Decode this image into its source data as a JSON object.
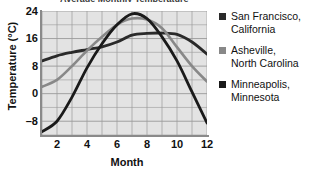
{
  "chart_data": {
    "type": "line",
    "title": "Average Monthly Temperature",
    "xlabel": "Month",
    "ylabel": "Temperature (°C)",
    "xlim": [
      1,
      12
    ],
    "ylim": [
      -12,
      24
    ],
    "xticks": [
      "2",
      "4",
      "6",
      "8",
      "10",
      "12"
    ],
    "xtick_values": [
      2,
      4,
      6,
      8,
      10,
      12
    ],
    "yticks": [
      "24",
      "16",
      "8",
      "0",
      "–8"
    ],
    "ytick_values": [
      24,
      16,
      8,
      0,
      -8
    ],
    "grid": true,
    "legend_position": "right",
    "x": [
      1,
      2,
      3,
      4,
      5,
      6,
      7,
      8,
      9,
      10,
      11,
      12
    ],
    "series": [
      {
        "name": "San Francisco, California",
        "color": "#2a2a2a",
        "values": [
          9.5,
          11.0,
          12.0,
          12.8,
          13.6,
          15.0,
          17.0,
          17.5,
          17.6,
          17.2,
          15.0,
          11.5
        ]
      },
      {
        "name": "Asheville, North Carolina",
        "color": "#888888",
        "values": [
          2.0,
          4.0,
          8.0,
          12.5,
          16.5,
          20.0,
          21.8,
          21.5,
          19.0,
          13.5,
          8.0,
          3.5
        ]
      },
      {
        "name": "Minneapolis, Minnesota",
        "color": "#1a1a1a",
        "values": [
          -11.0,
          -8.0,
          -1.0,
          7.5,
          14.5,
          20.0,
          23.2,
          21.8,
          16.5,
          9.5,
          0.5,
          -8.5
        ]
      }
    ]
  },
  "axes": {
    "y_title": "Temperature (°C)",
    "x_title": "Month",
    "y_labels": [
      "24",
      "16",
      "8",
      "0",
      "–8"
    ],
    "x_labels": [
      "2",
      "4",
      "6",
      "8",
      "10",
      "12"
    ]
  },
  "legend": {
    "entries": [
      {
        "line1": "San Francisco,",
        "line2": "California",
        "color": "#2a2a2a"
      },
      {
        "line1": "Asheville,",
        "line2": "North Carolina",
        "color": "#888888"
      },
      {
        "line1": "Minneapolis,",
        "line2": "Minnesota",
        "color": "#1a1a1a"
      }
    ]
  },
  "colors": {
    "plot_background": "#e3e3e3",
    "grid": "#9a9a9a",
    "axis": "#8a8a8a",
    "text": "#111111"
  }
}
